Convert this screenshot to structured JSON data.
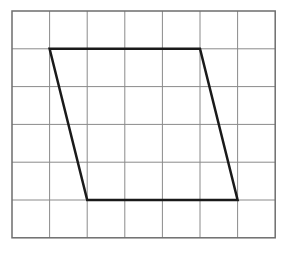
{
  "diagram": {
    "type": "grid-with-parallelogram",
    "grid": {
      "columns": 7,
      "rows": 6,
      "origin": [
        12,
        11
      ],
      "cell_width": 37.6,
      "cell_height": 37.8,
      "line_color": "#8a8a8a",
      "border_color": "#6e6e6e"
    },
    "shape": {
      "name": "parallelogram",
      "vertices_grid": [
        [
          1,
          1
        ],
        [
          5,
          1
        ],
        [
          6,
          5
        ],
        [
          2,
          5
        ]
      ],
      "stroke_color": "#1a1a1a",
      "stroke_width": 2.5
    }
  }
}
